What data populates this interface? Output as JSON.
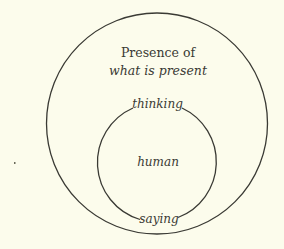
{
  "diagram": {
    "type": "nested-circles",
    "background": "#fcfcec",
    "stroke_color": "#3a3a34",
    "outer_circle": {
      "cx": 157,
      "cy": 123.5,
      "r": 110.5,
      "label_line1": "Presence of",
      "label_line2": "what is present"
    },
    "inner_circle": {
      "cx": 157.5,
      "cy": 162.5,
      "r": 59.5,
      "center_label": "human",
      "top_label": "thinking",
      "bottom_label": "saying"
    }
  }
}
